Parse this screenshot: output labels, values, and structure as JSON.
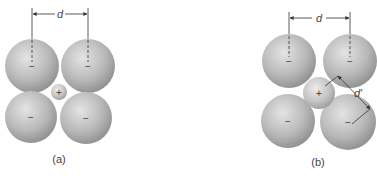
{
  "figure": {
    "panels": [
      {
        "id": "a",
        "caption": "(a)",
        "dimension_label": "d",
        "anion_sign": "−",
        "cation_sign": "+",
        "description": "Four large anions in contact around a small cation (cation too small to touch anions)"
      },
      {
        "id": "b",
        "caption": "(b)",
        "dimension_label": "d",
        "contact_label": "d′",
        "anion_sign": "−",
        "cation_sign": "+",
        "description": "Larger cation pushes anions apart; cation-anion contact distance d'"
      }
    ],
    "colors": {
      "sphere_light": "#e6e6e6",
      "sphere_dark": "#8a8a8a",
      "line": "#333333",
      "text": "#444444"
    }
  }
}
